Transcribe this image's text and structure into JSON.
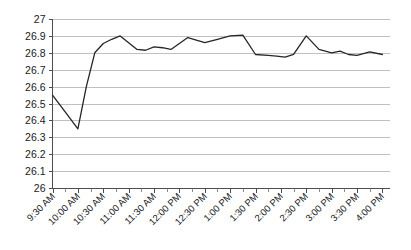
{
  "chart_data": {
    "type": "line",
    "title": "",
    "subtitle": "",
    "xlabel": "",
    "ylabel": "",
    "ylim": [
      26,
      27
    ],
    "ytick_step": 0.1,
    "grid": true,
    "legend": false,
    "legend_position": "none",
    "line_color": "#262626",
    "gridline_color": "#b0b0b0",
    "axis_color": "#4d4d4d",
    "background_color": "#ffffff",
    "ytick_labels": [
      "27",
      "26.9",
      "26.8",
      "26.7",
      "26.6",
      "26.5",
      "26.4",
      "26.3",
      "26.2",
      "26.1",
      "26"
    ],
    "ytick_values": [
      27,
      26.9,
      26.8,
      26.7,
      26.6,
      26.5,
      26.4,
      26.3,
      26.2,
      26.1,
      26
    ],
    "categories": [
      "9:30 AM",
      "10:00 AM",
      "10:30 AM",
      "11:00 AM",
      "11:30 AM",
      "12:00 PM",
      "12:30 PM",
      "1:00 PM",
      "1:30 PM",
      "2:00 PM",
      "2:30 PM",
      "3:00 PM",
      "3:30 PM",
      "4:00 PM"
    ],
    "series": [
      {
        "name": "Price",
        "x": [
          "9:30 AM",
          "9:45 AM",
          "10:00 AM",
          "10:10 AM",
          "10:20 AM",
          "10:30 AM",
          "10:40 AM",
          "10:50 AM",
          "11:00 AM",
          "11:10 AM",
          "11:20 AM",
          "11:30 AM",
          "11:40 AM",
          "11:50 AM",
          "12:00 PM",
          "12:10 PM",
          "12:20 PM",
          "12:30 PM",
          "12:45 PM",
          "1:00 PM",
          "1:15 PM",
          "1:30 PM",
          "1:45 PM",
          "1:55 PM",
          "2:05 PM",
          "2:15 PM",
          "2:30 PM",
          "2:45 PM",
          "3:00 PM",
          "3:10 PM",
          "3:20 PM",
          "3:30 PM",
          "3:45 PM",
          "4:00 PM"
        ],
        "values": [
          26.55,
          26.45,
          26.35,
          26.6,
          26.8,
          26.855,
          26.88,
          26.9,
          26.86,
          26.82,
          26.815,
          26.835,
          26.83,
          26.82,
          26.855,
          26.89,
          26.875,
          26.86,
          26.88,
          26.9,
          26.905,
          26.79,
          26.785,
          26.78,
          26.775,
          26.79,
          26.9,
          26.82,
          26.8,
          26.81,
          26.79,
          26.785,
          26.805,
          26.79
        ]
      }
    ]
  }
}
